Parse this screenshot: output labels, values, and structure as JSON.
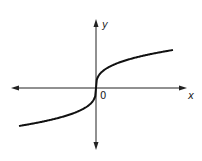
{
  "chart_data": {
    "type": "line",
    "title": "",
    "function": "y = cube root of x",
    "xlabel": "x",
    "ylabel": "y",
    "origin_label": "0",
    "series": [
      {
        "name": "y = x^(1/3)",
        "x": [
          -8,
          -6,
          -4,
          -2,
          -1,
          -0.5,
          -0.1,
          0,
          0.1,
          0.5,
          1,
          2,
          4,
          6,
          8
        ],
        "values": [
          -2,
          -1.817,
          -1.587,
          -1.26,
          -1,
          -0.794,
          -0.464,
          0,
          0.464,
          0.794,
          1,
          1.26,
          1.587,
          1.817,
          2
        ]
      }
    ],
    "axes": {
      "arrows": true,
      "ticks": false,
      "grid": false
    },
    "legend": "none"
  },
  "labels": {
    "x": "x",
    "y": "y",
    "origin": "0"
  },
  "colors": {
    "curve": "#111111",
    "axes": "#222222",
    "background": "#ffffff"
  }
}
